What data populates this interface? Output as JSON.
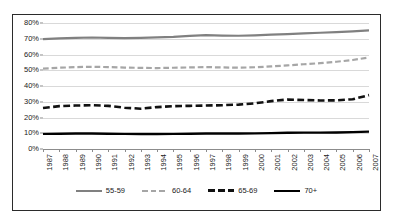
{
  "chart_data": {
    "type": "line",
    "title": "",
    "xlabel": "",
    "ylabel": "",
    "ylim": [
      0,
      80
    ],
    "ytick_labels": [
      "0%",
      "10%",
      "20%",
      "30%",
      "40%",
      "50%",
      "60%",
      "70%",
      "80%"
    ],
    "ytick_values": [
      0,
      10,
      20,
      30,
      40,
      50,
      60,
      70,
      80
    ],
    "grid": true,
    "legend_position": "bottom",
    "categories": [
      "1987",
      "1988",
      "1989",
      "1990",
      "1991",
      "1992",
      "1993",
      "1994",
      "1995",
      "1996",
      "1997",
      "1998",
      "1999",
      "2000",
      "2001",
      "2002",
      "2003",
      "2004",
      "2005",
      "2006",
      "2007"
    ],
    "series": [
      {
        "name": "55-59",
        "color": "#808080",
        "style": "solid",
        "width": 2.2,
        "values": [
          69.8,
          70.3,
          70.6,
          70.8,
          70.6,
          70.4,
          70.6,
          70.9,
          71.2,
          71.8,
          72.3,
          72.0,
          71.9,
          72.2,
          72.6,
          73.0,
          73.4,
          73.8,
          74.2,
          74.7,
          75.3
        ]
      },
      {
        "name": "60-64",
        "color": "#a6a6a6",
        "style": "dashed",
        "width": 2.2,
        "values": [
          51.0,
          51.6,
          52.0,
          52.2,
          52.0,
          51.7,
          51.5,
          51.4,
          51.6,
          51.8,
          52.0,
          51.8,
          51.6,
          51.9,
          52.4,
          53.1,
          53.8,
          54.5,
          55.4,
          56.5,
          58.1
        ]
      },
      {
        "name": "65-69",
        "color": "#111111",
        "style": "dashed",
        "width": 2.6,
        "values": [
          26.0,
          27.2,
          27.6,
          27.8,
          27.4,
          26.2,
          25.6,
          26.6,
          27.2,
          27.4,
          27.6,
          27.8,
          28.2,
          29.0,
          30.4,
          31.4,
          31.1,
          30.8,
          30.9,
          31.6,
          34.2
        ]
      },
      {
        "name": "70+",
        "color": "#000000",
        "style": "solid",
        "width": 2.4,
        "values": [
          9.6,
          9.7,
          9.8,
          9.8,
          9.7,
          9.6,
          9.5,
          9.5,
          9.6,
          9.7,
          9.8,
          9.8,
          9.8,
          9.9,
          10.1,
          10.3,
          10.4,
          10.4,
          10.5,
          10.7,
          11.0
        ]
      }
    ]
  }
}
